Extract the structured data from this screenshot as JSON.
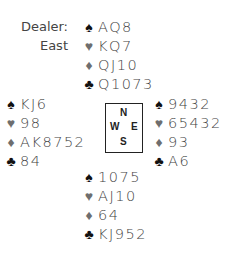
{
  "dealer": {
    "label": "Dealer:",
    "value": "East"
  },
  "suit_icons": {
    "spades": "♠",
    "hearts": "♥",
    "diamonds": "♦",
    "clubs": "♣"
  },
  "hands": {
    "north": {
      "spades": "AQ8",
      "hearts": "KQ7",
      "diamonds": "QJ10",
      "clubs": "Q1073"
    },
    "west": {
      "spades": "KJ6",
      "hearts": "98",
      "diamonds": "AK8752",
      "clubs": "84"
    },
    "east": {
      "spades": "9432",
      "hearts": "65432",
      "diamonds": "93",
      "clubs": "A6"
    },
    "south": {
      "spades": "1075",
      "hearts": "AJ10",
      "diamonds": "64",
      "clubs": "KJ952"
    }
  },
  "compass": {
    "n": "N",
    "w": "W",
    "e": "E",
    "s": "S"
  },
  "colors": {
    "black_suits": "#111111",
    "red_suits": "#6e6e6e",
    "text": "#444444",
    "box_border": "#222222"
  }
}
